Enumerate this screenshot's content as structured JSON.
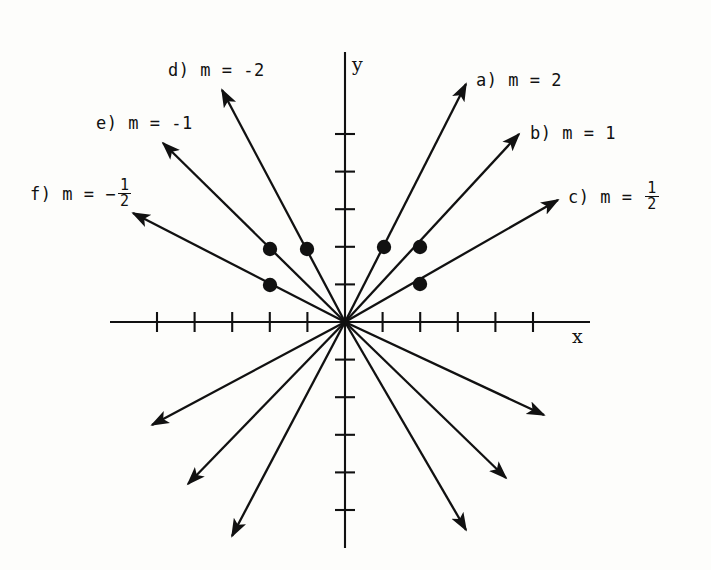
{
  "figure": {
    "type": "coordinate-plane-slope-diagram",
    "axes": {
      "x_label": "x",
      "y_label": "y",
      "origin_px": [
        345,
        322
      ],
      "tick_spacing_px": 37.6,
      "x_ticks_negative": 5,
      "x_ticks_positive": 5,
      "y_ticks_positive": 5,
      "y_ticks_negative": 5,
      "x_range_px": [
        110,
        590
      ],
      "y_range_px": [
        52,
        548
      ]
    },
    "ink_color": "#111111",
    "paper_color": "#fdfdfb"
  },
  "labels": [
    {
      "id": "a",
      "prefix": "a)",
      "body": "m = 2",
      "mode": "plain",
      "slope": 2,
      "x": 476,
      "y": 72
    },
    {
      "id": "b",
      "prefix": "b)",
      "body": "m = 1",
      "mode": "plain",
      "slope": 1,
      "x": 530,
      "y": 125
    },
    {
      "id": "c",
      "prefix": "c)",
      "body": "m = ",
      "mode": "fraction",
      "sign": "",
      "numerator": "1",
      "denominator": "2",
      "slope": 0.5,
      "x": 568,
      "y": 190
    },
    {
      "id": "d",
      "prefix": "d)",
      "body": "m = -2",
      "mode": "plain",
      "slope": -2,
      "x": 168,
      "y": 62
    },
    {
      "id": "e",
      "prefix": "e)",
      "body": "m = -1",
      "mode": "plain",
      "slope": -1,
      "x": 96,
      "y": 115
    },
    {
      "id": "f",
      "prefix": "f)",
      "body": "m = ",
      "mode": "fraction",
      "sign": "−",
      "numerator": "1",
      "denominator": "2",
      "slope": -0.5,
      "x": 30,
      "y": 187
    }
  ],
  "rays": [
    {
      "id": "a-up",
      "label": "a",
      "slope": 2,
      "dir": "up-right",
      "tip": [
        466,
        84
      ]
    },
    {
      "id": "a-down",
      "label": "a",
      "slope": 2,
      "dir": "down-left",
      "tip": [
        232,
        536
      ]
    },
    {
      "id": "b-up",
      "label": "b",
      "slope": 1,
      "dir": "up-right",
      "tip": [
        519,
        134
      ]
    },
    {
      "id": "b-down",
      "label": "b",
      "slope": 1,
      "dir": "down-left",
      "tip": [
        188,
        484
      ]
    },
    {
      "id": "c-up",
      "label": "c",
      "slope": 0.5,
      "dir": "up-right",
      "tip": [
        558,
        200
      ]
    },
    {
      "id": "c-down",
      "label": "c",
      "slope": 0.5,
      "dir": "down-left",
      "tip": [
        152,
        425
      ]
    },
    {
      "id": "d-up",
      "label": "d",
      "slope": -2,
      "dir": "up-left",
      "tip": [
        222,
        90
      ]
    },
    {
      "id": "d-down",
      "label": "d",
      "slope": -2,
      "dir": "down-right",
      "tip": [
        466,
        530
      ]
    },
    {
      "id": "e-up",
      "label": "e",
      "slope": -1,
      "dir": "up-left",
      "tip": [
        163,
        143
      ]
    },
    {
      "id": "e-down",
      "label": "e",
      "slope": -1,
      "dir": "down-right",
      "tip": [
        506,
        478
      ]
    },
    {
      "id": "f-up",
      "label": "f",
      "slope": -0.5,
      "dir": "up-left",
      "tip": [
        133,
        213
      ]
    },
    {
      "id": "f-down",
      "label": "f",
      "slope": -0.5,
      "dir": "down-right",
      "tip": [
        544,
        415
      ]
    }
  ],
  "points": [
    {
      "id": "pt-a",
      "label": "a",
      "graph_xy": [
        1,
        2
      ],
      "px": [
        384,
        247
      ]
    },
    {
      "id": "pt-b",
      "label": "b",
      "graph_xy": [
        2,
        2
      ],
      "px": [
        420,
        247
      ]
    },
    {
      "id": "pt-c",
      "label": "c",
      "graph_xy": [
        2,
        1
      ],
      "px": [
        420,
        284
      ]
    },
    {
      "id": "pt-d",
      "label": "d",
      "graph_xy": [
        -1,
        2
      ],
      "px": [
        307,
        249
      ]
    },
    {
      "id": "pt-e",
      "label": "e",
      "graph_xy": [
        -2,
        2
      ],
      "px": [
        270,
        249
      ]
    },
    {
      "id": "pt-f",
      "label": "f",
      "graph_xy": [
        -2,
        1
      ],
      "px": [
        270,
        285
      ]
    }
  ]
}
